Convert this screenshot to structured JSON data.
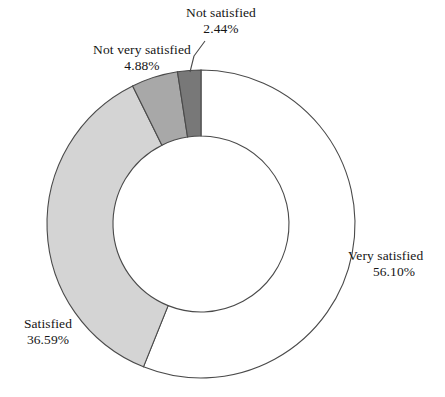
{
  "chart_data": {
    "type": "pie",
    "variant": "donut",
    "title": "",
    "subtitle": "",
    "xlabel": "",
    "ylabel": "",
    "legend_position": "none",
    "labels_position": "outside",
    "grid": false,
    "start_angle_deg": 0,
    "direction": "clockwise",
    "value_unit": "%",
    "categories": [
      "Very satisfied",
      "Satisfied",
      "Not very satisfied",
      "Not satisfied"
    ],
    "values": [
      56.1,
      36.59,
      4.88,
      2.44
    ],
    "value_labels": [
      "56.10%",
      "36.59%",
      "4.88%",
      "2.44%"
    ],
    "colors": [
      "#ffffff",
      "#d4d4d4",
      "#a8a8a8",
      "#787878"
    ],
    "slices": [
      {
        "name": "Very satisfied",
        "value": 56.1,
        "value_label": "56.10%",
        "color": "#ffffff",
        "leader_line": false
      },
      {
        "name": "Satisfied",
        "value": 36.59,
        "value_label": "36.59%",
        "color": "#d4d4d4",
        "leader_line": false
      },
      {
        "name": "Not very satisfied",
        "value": 4.88,
        "value_label": "4.88%",
        "color": "#a8a8a8",
        "leader_line": false
      },
      {
        "name": "Not satisfied",
        "value": 2.44,
        "value_label": "2.44%",
        "color": "#787878",
        "leader_line": true
      }
    ],
    "ylim": [
      0,
      100
    ],
    "stroke_color": "#4a4a4a",
    "background": "#ffffff"
  }
}
